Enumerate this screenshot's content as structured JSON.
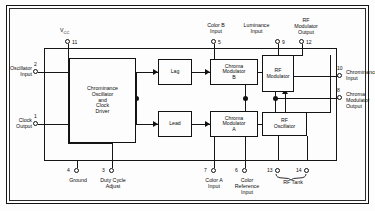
{
  "diagram": {
    "type": "block-diagram",
    "line_color": "#141414",
    "background": "#fdfdfd"
  },
  "blocks": [
    {
      "id": "chrominance-oscillator",
      "label": "Chrominance\nOscillator\nand\nClock\nDriver"
    },
    {
      "id": "lag",
      "label": "Lag"
    },
    {
      "id": "lead",
      "label": "Lead"
    },
    {
      "id": "chroma-modulator-b",
      "label": "Chroma\nModulator\nB"
    },
    {
      "id": "chroma-modulator-a",
      "label": "Chroma\nModulator\nA"
    },
    {
      "id": "rf-modulator",
      "label": "RF\nModulator"
    },
    {
      "id": "rf-oscillator",
      "label": "RF\nOscillator"
    }
  ],
  "pins": [
    {
      "number": "1",
      "label": "Clock\nOutput",
      "side": "left"
    },
    {
      "number": "2",
      "label": "Oscillator\nInput",
      "side": "left"
    },
    {
      "number": "3",
      "label": "Duty Cycle\nAdjust",
      "side": "bottom"
    },
    {
      "number": "4",
      "label": "Ground",
      "side": "bottom"
    },
    {
      "number": "5",
      "label": "Color B\nInput",
      "side": "top"
    },
    {
      "number": "6",
      "label": "Color\nReference\nInput",
      "side": "bottom"
    },
    {
      "number": "7",
      "label": "Color A\nInput",
      "side": "bottom"
    },
    {
      "number": "8",
      "label": "Chroma\nModulator\nOutput",
      "side": "right"
    },
    {
      "number": "9",
      "label": "Luminance\nInput",
      "side": "top"
    },
    {
      "number": "10",
      "label": "Chrominance\nInput",
      "side": "right"
    },
    {
      "number": "11",
      "label": "V",
      "side": "top",
      "sub": "CC"
    },
    {
      "number": "12",
      "label": "RF\nModulator\nOutput",
      "side": "top"
    },
    {
      "number": "13",
      "label": "",
      "side": "bottom"
    },
    {
      "number": "14",
      "label": "",
      "side": "bottom"
    }
  ],
  "annotations": [
    {
      "id": "rf-tank",
      "label": "RF Tank"
    }
  ]
}
